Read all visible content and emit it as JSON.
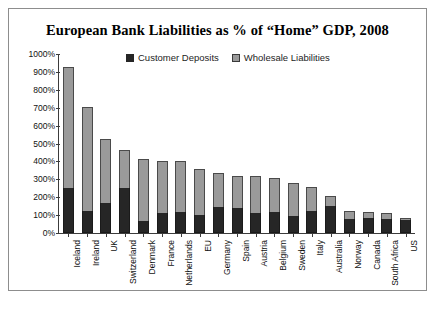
{
  "chart_data": {
    "type": "bar",
    "stacked": true,
    "title": "European Bank Liabilities as % of “Home” GDP, 2008",
    "xlabel": "",
    "ylabel": "",
    "ylim": [
      0,
      1000
    ],
    "ytick_step": 100,
    "ytick_labels": [
      "0%",
      "100%",
      "200%",
      "300%",
      "400%",
      "500%",
      "600%",
      "700%",
      "800%",
      "900%",
      "1000%"
    ],
    "grid": false,
    "legend_position": "top-center",
    "categories": [
      "Iceland",
      "Ireland",
      "UK",
      "Switzerland",
      "Denmark",
      "France",
      "Netherlands",
      "EU",
      "Germany",
      "Spain",
      "Austria",
      "Belgium",
      "Sweden",
      "Italy",
      "Australia",
      "Norway",
      "Canada",
      "South Africa",
      "US"
    ],
    "series": [
      {
        "name": "Customer Deposits",
        "color": "#262626",
        "values": [
          250,
          125,
          170,
          250,
          65,
          110,
          120,
          100,
          145,
          140,
          110,
          120,
          95,
          125,
          150,
          80,
          85,
          80,
          70
        ]
      },
      {
        "name": "Wholesale Liabilities",
        "color": "#9a9a9a",
        "values": [
          675,
          580,
          355,
          215,
          350,
          295,
          280,
          255,
          190,
          180,
          210,
          185,
          185,
          130,
          55,
          45,
          35,
          30,
          15
        ]
      }
    ],
    "totals": [
      925,
      705,
      525,
      465,
      415,
      405,
      400,
      355,
      335,
      320,
      320,
      305,
      280,
      255,
      205,
      125,
      120,
      110,
      85
    ]
  },
  "legend": {
    "entries": [
      {
        "label": "Customer Deposits",
        "swatch": "dark-square-swatch"
      },
      {
        "label": "Wholesale Liabilities",
        "swatch": "gray-square-swatch"
      }
    ]
  },
  "colors": {
    "deposits": "#262626",
    "wholesale": "#9a9a9a",
    "axis": "#3c3c3c",
    "frame": "#8d8d8d",
    "background": "#ffffff"
  }
}
